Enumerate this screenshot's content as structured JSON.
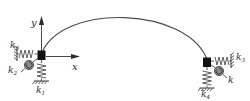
{
  "diagram": {
    "type": "mechanics-schematic",
    "stroke_color": "#3a3a3a",
    "block_color": "#111111",
    "spring_color": "#4a4a4a",
    "background": "#ffffff",
    "axes": {
      "origin_label": "",
      "x_label": "x",
      "y_label": "y",
      "x_direction": "right",
      "y_direction": "up"
    },
    "arch": {
      "name": "arch-curve",
      "left_end": [
        41,
        55
      ],
      "right_end": [
        208,
        62
      ],
      "apex": [
        126,
        10
      ]
    },
    "supports": [
      {
        "side": "left",
        "block": [
          38,
          51,
          8,
          9
        ],
        "springs": [
          {
            "name": "vertical-spring-left",
            "label": "k",
            "subscript": "1",
            "orientation": "vertical"
          },
          {
            "name": "rotational-spring-left",
            "label": "k",
            "subscript": "2",
            "orientation": "rotational"
          },
          {
            "name": "horizontal-spring-left",
            "label": "k",
            "subscript": "3",
            "orientation": "horizontal"
          }
        ]
      },
      {
        "side": "right",
        "block": [
          203,
          58,
          8,
          9
        ],
        "springs": [
          {
            "name": "vertical-spring-right",
            "label": "k",
            "subscript": "4",
            "orientation": "vertical"
          },
          {
            "name": "rotational-spring-right",
            "label": "k",
            "subscript": "",
            "orientation": "rotational"
          },
          {
            "name": "horizontal-spring-right",
            "label": "k",
            "subscript": "3",
            "orientation": "horizontal"
          }
        ]
      }
    ],
    "labels": {
      "k1": {
        "base": "k",
        "sub": "1"
      },
      "k2": {
        "base": "k",
        "sub": "2"
      },
      "k3": {
        "base": "k",
        "sub": "3"
      },
      "k4": {
        "base": "k",
        "sub": "4"
      },
      "k3r": {
        "base": "k",
        "sub": "3"
      },
      "k_plain": {
        "base": "k",
        "sub": ""
      },
      "x": {
        "base": "x",
        "sub": ""
      },
      "y": {
        "base": "y",
        "sub": ""
      }
    }
  }
}
